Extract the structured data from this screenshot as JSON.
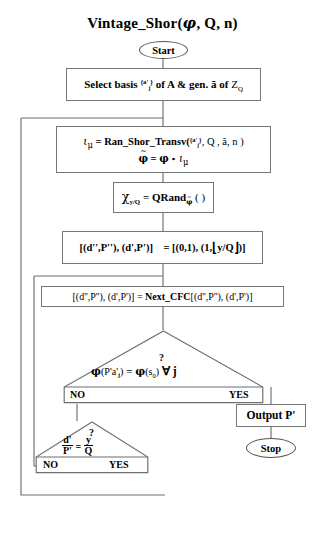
{
  "diagram": {
    "title": "Vintage_Shor(φ, Q, n)",
    "title_parts": {
      "name": "Vintage_Shor(",
      "arg1": "φ",
      "rest": ", Q, n)"
    },
    "type": "flowchart"
  },
  "nodes": {
    "start": {
      "label": "Start",
      "shape": "terminator"
    },
    "select_basis": {
      "shape": "process",
      "text": "Select basis {a'j} of A & gen. ã of ZQ",
      "parts": {
        "lead": "Select basis",
        "set_open": "{a'",
        "set_sub": "j",
        "set_close": "}",
        "mid": "of A & gen.",
        "gen": "ã",
        "of": "of",
        "z": "Z",
        "z_sub": "Q"
      }
    },
    "ran_shor_transv": {
      "shape": "process",
      "line1": "ιμ = Ran_Shor_Transv({a'j}, Q, ã, n )",
      "line2": "φ̃ = φ ∘ ιμ",
      "parts": {
        "iota": "ι",
        "mu": "μ",
        "eq": "=",
        "fn": "Ran_Shor_Transv(",
        "set_open": "{a'",
        "set_sub": "j",
        "set_close": "}",
        "args": ", Q , ã, n )",
        "phi_tilde": "φ",
        "eq2": "=",
        "phi": "φ",
        "comp": "∘"
      }
    },
    "qrand": {
      "shape": "process",
      "text": "χy/Q = QRandφ̃ ( )",
      "parts": {
        "chi": "χ",
        "chi_sub": "y/Q",
        "eq": "=",
        "fn": "QRand",
        "fn_sub": "φ",
        "parens": "( )"
      }
    },
    "init_pairs": {
      "shape": "process",
      "text": "[(d'',P''), (d',P')]   = [(0,1), (1, ⌊y/Q⌋ )]",
      "parts": {
        "lhs": "[(d'',P''), (d',P')]",
        "eq": "= [(0,1), (1,",
        "floor_open": "⌊",
        "floor_body": "y/Q",
        "floor_close": "⌋",
        "tail": ")]"
      }
    },
    "next_cfc": {
      "shape": "process",
      "text": "[(d'',P''), (d',P')] = Next_CFC[(d'',P''), (d',P')]",
      "parts": {
        "lhs": "[(d'',P''), (d',P')] =",
        "fn": "Next_CFC",
        "rhs": "[(d'',P''), (d',P')]"
      }
    },
    "decision_phi": {
      "shape": "decision",
      "question_mark": "?",
      "text": "φ(P'a'j) = φ(s0) ∀ j",
      "parts": {
        "phi1": "φ",
        "arg1_open": "(P'a'",
        "arg1_sub": "j",
        "arg1_close": ")",
        "eq": "=",
        "phi2": "φ",
        "arg2_open": "(s",
        "arg2_sub": "0",
        "arg2_close": ")",
        "forall": "∀ j"
      },
      "no_label": "NO",
      "yes_label": "YES"
    },
    "decision_frac": {
      "shape": "decision",
      "question_mark": "?",
      "text": "d'/P' = y/Q",
      "parts": {
        "num1": "d'",
        "den1": "P'",
        "eq": "=",
        "num2": "y",
        "den2": "Q"
      },
      "no_label": "NO",
      "yes_label": "YES"
    },
    "output": {
      "shape": "process",
      "label": "Output  P'"
    },
    "stop": {
      "label": "Stop",
      "shape": "terminator"
    }
  },
  "edges": [
    {
      "from": "start",
      "to": "select_basis",
      "label": ""
    },
    {
      "from": "select_basis",
      "to": "ran_shor_transv",
      "label": ""
    },
    {
      "from": "ran_shor_transv",
      "to": "qrand",
      "label": ""
    },
    {
      "from": "qrand",
      "to": "init_pairs",
      "label": ""
    },
    {
      "from": "init_pairs",
      "to": "next_cfc",
      "label": ""
    },
    {
      "from": "next_cfc",
      "to": "decision_phi",
      "label": ""
    },
    {
      "from": "decision_phi",
      "to": "output",
      "label": "YES"
    },
    {
      "from": "decision_phi",
      "to": "decision_frac",
      "label": "NO"
    },
    {
      "from": "decision_frac",
      "to": "next_cfc",
      "label": "NO"
    },
    {
      "from": "decision_frac",
      "to": "ran_shor_transv",
      "label": "YES"
    },
    {
      "from": "output",
      "to": "stop",
      "label": ""
    }
  ],
  "colors": {
    "line": "#6e6e6e",
    "box_border": "#787878",
    "text": "#000000",
    "background": "#ffffff"
  }
}
